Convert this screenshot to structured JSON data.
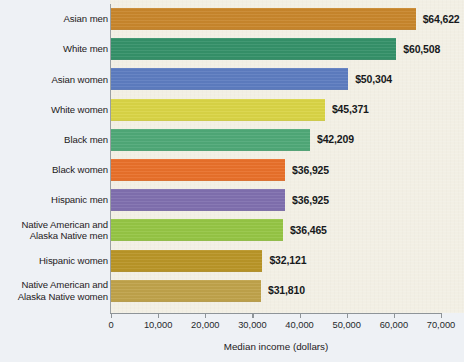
{
  "chart_data": {
    "type": "bar",
    "orientation": "horizontal",
    "title": "",
    "xlabel": "Median income (dollars)",
    "ylabel": "",
    "xlim": [
      0,
      70000
    ],
    "xticks": [
      0,
      10000,
      20000,
      30000,
      40000,
      50000,
      60000,
      70000
    ],
    "xtick_labels": [
      "0",
      "10,000",
      "20,000",
      "30,000",
      "40,000",
      "50,000",
      "60,000",
      "70,000"
    ],
    "grid": false,
    "legend": false,
    "categories": [
      "Asian men",
      "White men",
      "Asian women",
      "White women",
      "Black men",
      "Black women",
      "Hispanic men",
      "Native American and\nAlaska Native men",
      "Hispanic women",
      "Native American and\nAlaska Native women"
    ],
    "values": [
      64622,
      60508,
      50304,
      45371,
      42209,
      36925,
      36925,
      36465,
      32121,
      31810
    ],
    "value_labels": [
      "$64,622",
      "$60,508",
      "$50,304",
      "$45,371",
      "$42,209",
      "$36,925",
      "$36,925",
      "$36,465",
      "$32,121",
      "$31,810"
    ],
    "bar_colors": [
      "#c8862c",
      "#359169",
      "#5d7cc0",
      "#d9d445",
      "#4fa877",
      "#e8702a",
      "#7f6fae",
      "#95c544",
      "#b99527",
      "#bfa24a"
    ]
  },
  "colors": {
    "plot_background": "#f2efe4",
    "gutter_background": "#eef1f5",
    "axis": "#8e9498",
    "text": "#1d2022"
  }
}
